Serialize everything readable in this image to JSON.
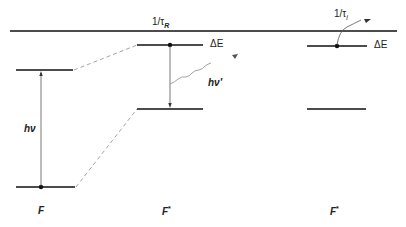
{
  "diagram": {
    "top_level_label": "1/τ",
    "top_level_sub": "R",
    "right_rate_label": "1/τ",
    "right_rate_sub": "i",
    "delta_e_middle": "ΔE",
    "delta_e_right": "ΔE",
    "absorption_label": "hν",
    "emission_label": "hν′",
    "columns": [
      {
        "label": "F",
        "star": ""
      },
      {
        "label": "F",
        "star": "*"
      },
      {
        "label": "F",
        "star": "*"
      }
    ],
    "colors": {
      "line": "#111111",
      "dashed": "#999999",
      "wavy": "#999999"
    }
  }
}
